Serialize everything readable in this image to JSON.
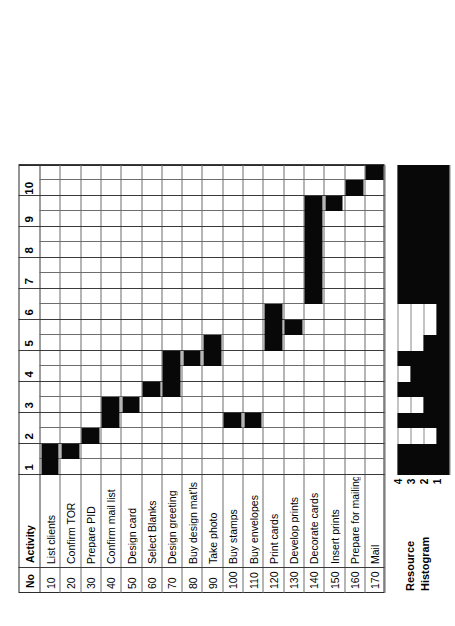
{
  "chart_data": {
    "type": "bar",
    "xlabel": "",
    "ylabel": "",
    "xlim": [
      0,
      10
    ],
    "grid": true,
    "time_unit_label": "",
    "time_ticks": [
      "1",
      "2",
      "3",
      "4",
      "5",
      "6",
      "7",
      "8",
      "9",
      "10"
    ],
    "columns": [
      "No",
      "Activity"
    ],
    "categories": [
      "List clients",
      "Confirm TOR",
      "Prepare PID",
      "Confirm mail list",
      "Design card",
      "Select Blanks",
      "Design greeting",
      "Buy design mat'ls",
      "Take photo",
      "Buy stamps",
      "Buy envelopes",
      "Print cards",
      "Develop prints",
      "Decorate cards",
      "Insert prints",
      "Prepare for mailing",
      "Mail"
    ],
    "tasks": [
      {
        "no": "10",
        "activity": "List clients",
        "start": 0.0,
        "end": 1.0
      },
      {
        "no": "20",
        "activity": "Confirm TOR",
        "start": 0.5,
        "end": 1.0
      },
      {
        "no": "30",
        "activity": "Prepare PID",
        "start": 1.0,
        "end": 1.5
      },
      {
        "no": "40",
        "activity": "Confirm mail list",
        "start": 1.5,
        "end": 2.5
      },
      {
        "no": "50",
        "activity": "Design card",
        "start": 2.0,
        "end": 2.5
      },
      {
        "no": "60",
        "activity": "Select Blanks",
        "start": 2.5,
        "end": 3.0
      },
      {
        "no": "70",
        "activity": "Design greeting",
        "start": 2.5,
        "end": 4.0
      },
      {
        "no": "80",
        "activity": "Buy design mat'ls",
        "start": 3.5,
        "end": 4.0
      },
      {
        "no": "90",
        "activity": "Take photo",
        "start": 3.5,
        "end": 4.5
      },
      {
        "no": "100",
        "activity": "Buy stamps",
        "start": 1.5,
        "end": 2.0
      },
      {
        "no": "110",
        "activity": "Buy envelopes",
        "start": 1.5,
        "end": 2.0
      },
      {
        "no": "120",
        "activity": "Print cards",
        "start": 4.0,
        "end": 5.5
      },
      {
        "no": "130",
        "activity": "Develop prints",
        "start": 4.5,
        "end": 5.0
      },
      {
        "no": "140",
        "activity": "Decorate cards",
        "start": 5.5,
        "end": 9.0
      },
      {
        "no": "150",
        "activity": "Insert prints",
        "start": 8.5,
        "end": 9.0
      },
      {
        "no": "160",
        "activity": "Prepare for mailing",
        "start": 9.0,
        "end": 9.5
      },
      {
        "no": "170",
        "activity": "Mail",
        "start": 9.5,
        "end": 10.0
      }
    ],
    "histogram": {
      "title_line1": "Resource",
      "title_line2": "Histogram",
      "levels": [
        "1",
        "2",
        "3",
        "4"
      ],
      "ylim": [
        0,
        4
      ],
      "steps": [
        {
          "start": 0.0,
          "end": 1.0,
          "value": 4
        },
        {
          "start": 1.0,
          "end": 1.5,
          "value": 1
        },
        {
          "start": 1.5,
          "end": 2.0,
          "value": 4
        },
        {
          "start": 2.0,
          "end": 2.5,
          "value": 2
        },
        {
          "start": 2.5,
          "end": 3.0,
          "value": 4
        },
        {
          "start": 3.0,
          "end": 3.5,
          "value": 3
        },
        {
          "start": 3.5,
          "end": 4.0,
          "value": 4
        },
        {
          "start": 4.0,
          "end": 4.5,
          "value": 2
        },
        {
          "start": 4.5,
          "end": 5.5,
          "value": 1
        },
        {
          "start": 5.5,
          "end": 10.0,
          "value": 4
        }
      ]
    }
  },
  "table": {
    "header": {
      "no": "No",
      "activity": "Activity"
    },
    "rows": [
      {
        "no": "10",
        "activity": "List clients"
      },
      {
        "no": "20",
        "activity": "Confirm TOR"
      },
      {
        "no": "30",
        "activity": "Prepare PID"
      },
      {
        "no": "40",
        "activity": "Confirm mail list"
      },
      {
        "no": "50",
        "activity": "Design card"
      },
      {
        "no": "60",
        "activity": "Select Blanks"
      },
      {
        "no": "70",
        "activity": "Design greeting"
      },
      {
        "no": "80",
        "activity": "Buy design mat'ls"
      },
      {
        "no": "90",
        "activity": "Take photo"
      },
      {
        "no": "100",
        "activity": "Buy stamps"
      },
      {
        "no": "110",
        "activity": "Buy envelopes"
      },
      {
        "no": "120",
        "activity": "Print cards"
      },
      {
        "no": "130",
        "activity": "Develop prints"
      },
      {
        "no": "140",
        "activity": "Decorate cards"
      },
      {
        "no": "150",
        "activity": "Insert prints"
      },
      {
        "no": "160",
        "activity": "Prepare for mailing"
      },
      {
        "no": "170",
        "activity": "Mail"
      }
    ]
  },
  "colors": {
    "bar": "#080808",
    "grid": "#6d6d6d",
    "grid_major": "#3a3a3a",
    "background": "#ffffff",
    "text": "#000000"
  }
}
